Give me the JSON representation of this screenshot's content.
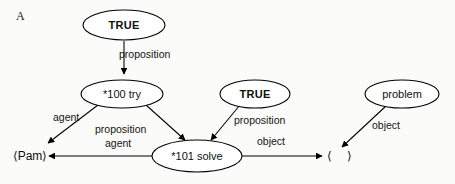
{
  "figure": {
    "panel_letter": "A",
    "background_color": "#fbfbf9",
    "stroke_color": "#000000"
  },
  "nodes": {
    "true_top": {
      "label": "TRUE",
      "bold": true,
      "cx": 124,
      "cy": 25,
      "rx": 41,
      "ry": 15
    },
    "try_100": {
      "label": "*100 try",
      "bold": false,
      "cx": 122,
      "cy": 94,
      "rx": 41,
      "ry": 14
    },
    "true_mid": {
      "label": "TRUE",
      "bold": true,
      "cx": 255,
      "cy": 94,
      "rx": 35,
      "ry": 14
    },
    "problem": {
      "label": "problem",
      "bold": false,
      "cx": 402,
      "cy": 94,
      "rx": 37,
      "ry": 14
    },
    "solve_101": {
      "label": "*101 solve",
      "bold": false,
      "cx": 197,
      "cy": 156,
      "rx": 45,
      "ry": 16
    },
    "pam": {
      "label": "⟨Pam⟩",
      "bold": false,
      "cx": 30,
      "cy": 156
    },
    "empty_concept": {
      "label": "⟨    ⟩",
      "open": "⟨",
      "close": "⟩",
      "bold": false,
      "cx": 338,
      "cy": 156
    }
  },
  "edges": [
    {
      "id": "true-top-to-try",
      "label": "proposition",
      "from": "true_top",
      "to": "try_100",
      "label_x": 119,
      "label_y": 58
    },
    {
      "id": "try-to-pam",
      "label": "agent",
      "from": "try_100",
      "to": "pam",
      "label_x": 53,
      "label_y": 121
    },
    {
      "id": "try-to-solve",
      "label": "proposition",
      "from": "try_100",
      "to": "solve_101",
      "label_x": 95,
      "label_y": 133
    },
    {
      "id": "true-mid-to-solve",
      "label": "proposition",
      "from": "true_mid",
      "to": "solve_101",
      "label_x": 234,
      "label_y": 124
    },
    {
      "id": "solve-to-pam",
      "label": "agent",
      "from": "solve_101",
      "to": "pam",
      "label_x": 105,
      "label_y": 147
    },
    {
      "id": "solve-to-empty",
      "label": "object",
      "from": "solve_101",
      "to": "empty_concept",
      "label_x": 257,
      "label_y": 145
    },
    {
      "id": "problem-to-empty",
      "label": "object",
      "from": "problem",
      "to": "empty_concept",
      "label_x": 372,
      "label_y": 129
    }
  ],
  "labels": {
    "proposition": "proposition",
    "agent": "agent",
    "object": "object"
  }
}
